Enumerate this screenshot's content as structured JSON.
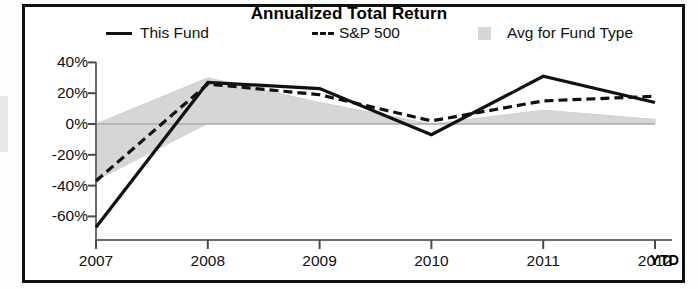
{
  "figure": {
    "title": "Annualized Total Return",
    "ytd_note": "YTD"
  },
  "legend": {
    "items": [
      {
        "label": "This Fund",
        "marker": "solid-line-swatch",
        "color": "#111111"
      },
      {
        "label": "S&P 500",
        "marker": "dashed-line-swatch",
        "color": "#111111"
      },
      {
        "label": "Avg for Fund Type",
        "marker": "area-swatch",
        "color": "#d6d6d6"
      }
    ]
  },
  "axes": {
    "y_ticks": [
      "40%",
      "20%",
      "0%",
      "-20%",
      "-40%",
      "-60%"
    ],
    "x_ticks": [
      "2007",
      "2008",
      "2009",
      "2010",
      "2011",
      "2012"
    ]
  },
  "chart_data": {
    "type": "line",
    "title": "Annualized Total Return",
    "xlabel": "",
    "ylabel": "",
    "categories": [
      "2007",
      "2008",
      "2009",
      "2010",
      "2011",
      "2012"
    ],
    "x": [
      2007,
      2008,
      2009,
      2010,
      2011,
      2012
    ],
    "ylim": [
      -68,
      40
    ],
    "xlim": [
      2007,
      2012
    ],
    "grid": false,
    "legend_position": "top",
    "y_tick_values": [
      40,
      20,
      0,
      -20,
      -40,
      -60
    ],
    "zero_baseline": 0,
    "series": [
      {
        "name": "This Fund",
        "style": "solid",
        "color": "#111111",
        "values": [
          -67,
          27,
          23,
          -7,
          31,
          14
        ]
      },
      {
        "name": "S&P 500",
        "style": "dashed",
        "color": "#111111",
        "values": [
          -37,
          26,
          19,
          2,
          15,
          18
        ]
      },
      {
        "name": "Avg for Fund Type",
        "style": "area",
        "color": "#d6d6d6",
        "values": [
          0,
          30,
          14,
          0,
          9,
          3
        ]
      }
    ]
  }
}
